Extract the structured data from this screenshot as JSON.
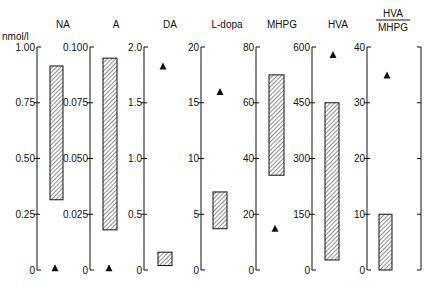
{
  "unit_label": "nmol/l",
  "colors": {
    "ink": "#111111",
    "background": "#ffffff",
    "hatch": "#444444"
  },
  "layout": {
    "axis_top_px": 47,
    "axis_bottom_px": 270
  },
  "chart_data": {
    "type": "range-bar",
    "unit": "nmol/l",
    "legend": {
      "hatched_bar": "range",
      "triangle": "single value"
    },
    "panels": [
      {
        "title": "NA",
        "axis_x": 37,
        "ylim": [
          0,
          1.0
        ],
        "ticks": [
          "0",
          "0.25",
          "0.50",
          "0.75",
          "1.00"
        ],
        "tick_values": [
          0,
          0.25,
          0.5,
          0.75,
          1.0
        ],
        "bar": {
          "low": 0.315,
          "high": 0.915,
          "x": 50,
          "w": 13
        },
        "triangle": {
          "value": 0.01,
          "x": 55
        }
      },
      {
        "title": "A",
        "axis_x": 90,
        "ylim": [
          0,
          0.1
        ],
        "ticks": [
          "0",
          "0.025",
          "0.050",
          "0.075",
          "0.100"
        ],
        "tick_values": [
          0,
          0.025,
          0.05,
          0.075,
          0.1
        ],
        "bar": {
          "low": 0.018,
          "high": 0.095,
          "x": 103,
          "w": 14
        },
        "triangle": {
          "value": 0.001,
          "x": 109
        }
      },
      {
        "title": "DA",
        "axis_x": 144,
        "ylim": [
          0,
          2.0
        ],
        "ticks": [
          "0",
          "0.5",
          "1.0",
          "1.5",
          "2.0"
        ],
        "tick_values": [
          0,
          0.5,
          1.0,
          1.5,
          2.0
        ],
        "bar": {
          "low": 0.04,
          "high": 0.16,
          "x": 158,
          "w": 14
        },
        "triangle": {
          "value": 1.83,
          "x": 163
        }
      },
      {
        "title": "L-dopa",
        "axis_x": 201,
        "ylim": [
          0,
          20
        ],
        "ticks": [
          "0",
          "5",
          "10",
          "15",
          "20"
        ],
        "tick_values": [
          0,
          5,
          10,
          15,
          20
        ],
        "bar": {
          "low": 3.7,
          "high": 7.0,
          "x": 213,
          "w": 14
        },
        "triangle": {
          "value": 16,
          "x": 220
        }
      },
      {
        "title": "MHPG",
        "axis_x": 256,
        "ylim": [
          0,
          80
        ],
        "ticks": [
          "0",
          "20",
          "40",
          "60",
          "80"
        ],
        "tick_values": [
          0,
          20,
          40,
          60,
          80
        ],
        "bar": {
          "low": 34,
          "high": 70,
          "x": 269,
          "w": 15
        },
        "triangle": {
          "value": 15,
          "x": 275
        }
      },
      {
        "title": "HVA",
        "axis_x": 312,
        "ylim": [
          0,
          600
        ],
        "ticks": [
          "0",
          "150",
          "300",
          "450",
          "600"
        ],
        "tick_values": [
          0,
          150,
          300,
          450,
          600
        ],
        "bar": {
          "low": 27,
          "high": 450,
          "x": 325,
          "w": 14
        },
        "triangle": {
          "value": 580,
          "x": 333
        }
      },
      {
        "title_numerator": "HVA",
        "title_denominator": "MHPG",
        "title": "HVA/MHPG",
        "axis_x": 367,
        "right_axis_x": 421,
        "ylim": [
          0,
          40
        ],
        "ticks": [
          "0",
          "10",
          "20",
          "30",
          "40"
        ],
        "tick_values": [
          0,
          10,
          20,
          30,
          40
        ],
        "bar": {
          "low": 0,
          "high": 10,
          "x": 379,
          "w": 13
        },
        "triangle": {
          "value": 35,
          "x": 387
        }
      }
    ]
  }
}
